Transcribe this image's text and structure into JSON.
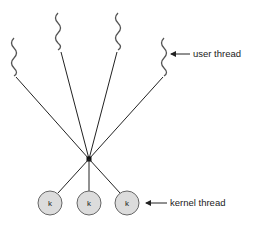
{
  "diagram": {
    "type": "many-to-one threading model",
    "labels": {
      "user_thread": "user thread",
      "kernel_thread": "kernel thread"
    },
    "kernel_threads": [
      {
        "label": "k"
      },
      {
        "label": "k"
      },
      {
        "label": "k"
      }
    ],
    "user_thread_count": 4,
    "colors": {
      "line": "#222222",
      "wave": "#555555",
      "circle_fill": "#dcdcdc",
      "circle_stroke": "#666666"
    }
  }
}
